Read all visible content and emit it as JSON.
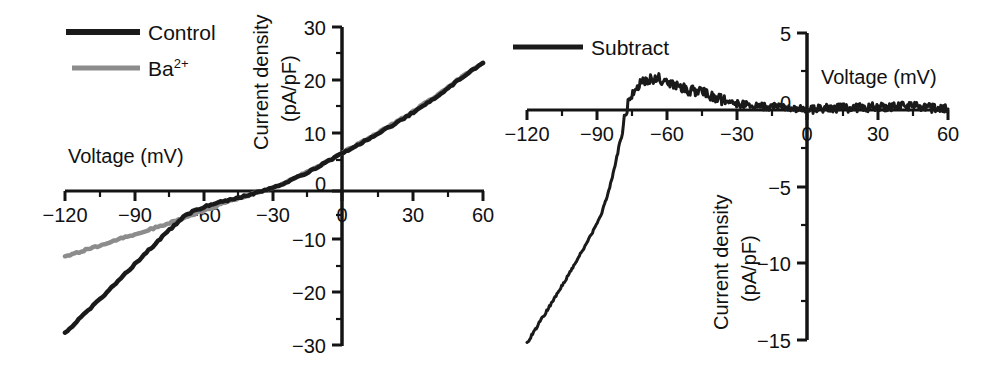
{
  "figure": {
    "background": "#ffffff",
    "panels": [
      "left",
      "right"
    ]
  },
  "colors": {
    "control": "#1a1a1a",
    "barium": "#8c8c8c",
    "subtract": "#1a1a1a",
    "axis": "#141414",
    "text": "#111111"
  },
  "left_panel": {
    "legend": {
      "items": [
        {
          "label": "Control",
          "color": "#1a1a1a"
        },
        {
          "label": "Ba",
          "superscript": "2+",
          "color": "#8c8c8c"
        }
      ]
    },
    "xlabel": "Voltage (mV)",
    "ylabel_line1": "Current density",
    "ylabel_line2": "(pA/pF)",
    "xticklabels": [
      "−120",
      "−90",
      "−60",
      "−30",
      "0",
      "30",
      "60"
    ],
    "yticklabels": [
      "30",
      "20",
      "10",
      "0",
      "−10",
      "−20",
      "−30"
    ]
  },
  "right_panel": {
    "legend": {
      "items": [
        {
          "label": "Subtract",
          "color": "#1a1a1a"
        }
      ]
    },
    "xlabel": "Voltage (mV)",
    "ylabel_line1": "Current density",
    "ylabel_line2": "(pA/pF)",
    "xticklabels": [
      "−120",
      "−90",
      "−60",
      "−30",
      "0",
      "30",
      "60"
    ],
    "yticklabels": [
      "5",
      "0",
      "−5",
      "−10",
      "−15"
    ]
  },
  "chart_data": [
    {
      "type": "line",
      "panel": "left",
      "title": "",
      "xlabel": "Voltage (mV)",
      "ylabel": "Current density (pA/pF)",
      "xlim": [
        -120,
        60
      ],
      "ylim": [
        -30,
        30
      ],
      "xticks": [
        -120,
        -90,
        -60,
        -30,
        0,
        30,
        60
      ],
      "yticks": [
        30,
        20,
        10,
        0,
        -10,
        -20,
        -30
      ],
      "xminorticks": [
        -105,
        -75,
        -45,
        -15,
        15,
        45
      ],
      "yminorticks": [
        25,
        15,
        5,
        -5,
        -15,
        -25
      ],
      "grid": false,
      "legend_position": "top-left",
      "series": [
        {
          "name": "Control",
          "color": "#1a1a1a",
          "x": [
            -120,
            -115,
            -110,
            -105,
            -100,
            -95,
            -90,
            -85,
            -80,
            -75,
            -72,
            -70,
            -67,
            -64,
            -60,
            -55,
            -50,
            -45,
            -40,
            -35,
            -30,
            -25,
            -20,
            -15,
            -10,
            -5,
            0,
            5,
            10,
            15,
            20,
            25,
            30,
            35,
            40,
            45,
            50,
            55,
            60
          ],
          "y": [
            -27.8,
            -25.6,
            -23.5,
            -21.3,
            -19.2,
            -17.0,
            -14.8,
            -12.6,
            -10.4,
            -8.3,
            -7.1,
            -6.2,
            -5.3,
            -4.6,
            -3.9,
            -3.2,
            -2.7,
            -2.2,
            -1.6,
            -1.0,
            -0.3,
            0.6,
            1.6,
            2.7,
            3.9,
            5.1,
            6.3,
            7.5,
            8.7,
            9.9,
            11.2,
            12.5,
            13.9,
            15.4,
            16.9,
            18.5,
            20.1,
            21.7,
            23.2
          ]
        },
        {
          "name": "Ba2+",
          "color": "#8c8c8c",
          "x": [
            -120,
            -115,
            -110,
            -105,
            -100,
            -95,
            -90,
            -85,
            -80,
            -75,
            -70,
            -65,
            -60,
            -55,
            -50,
            -45,
            -40,
            -35,
            -30,
            -25,
            -20,
            -15,
            -10,
            -5,
            0,
            5,
            10,
            15,
            20,
            25,
            30,
            35,
            40,
            45,
            50,
            55,
            60
          ],
          "y": [
            -13.3,
            -12.6,
            -11.9,
            -11.2,
            -10.5,
            -9.8,
            -9.1,
            -8.4,
            -7.7,
            -7.0,
            -6.2,
            -5.4,
            -4.6,
            -3.8,
            -3.0,
            -2.3,
            -1.6,
            -0.9,
            -0.2,
            0.7,
            1.7,
            2.8,
            4.0,
            5.2,
            6.4,
            7.6,
            8.8,
            10.1,
            11.4,
            12.7,
            14.1,
            15.6,
            17.1,
            18.7,
            20.3,
            21.8,
            23.3
          ]
        }
      ]
    },
    {
      "type": "line",
      "panel": "right",
      "title": "",
      "xlabel": "Voltage (mV)",
      "ylabel": "Current density (pA/pF)",
      "xlim": [
        -120,
        60
      ],
      "ylim": [
        -15,
        5
      ],
      "xticks": [
        -120,
        -90,
        -60,
        -30,
        0,
        30,
        60
      ],
      "yticks": [
        5,
        0,
        -5,
        -10,
        -15
      ],
      "xminorticks": [
        -105,
        -75,
        -45,
        -15,
        15,
        45
      ],
      "yminorticks": [
        2.5,
        -2.5,
        -7.5,
        -12.5
      ],
      "grid": false,
      "legend_position": "top-left",
      "series": [
        {
          "name": "Subtract",
          "color": "#1a1a1a",
          "x": [
            -120,
            -116,
            -112,
            -108,
            -104,
            -100,
            -96,
            -92,
            -88,
            -85,
            -82,
            -80,
            -78,
            -76,
            -74,
            -72,
            -70,
            -68,
            -66,
            -64,
            -62,
            -60,
            -57,
            -54,
            -51,
            -48,
            -45,
            -42,
            -39,
            -36,
            -33,
            -30,
            -25,
            -20,
            -15,
            -10,
            -5,
            0,
            5,
            10,
            15,
            20,
            25,
            30,
            35,
            40,
            45,
            50,
            55,
            60
          ],
          "y": [
            -15.2,
            -14.2,
            -13.2,
            -12.2,
            -11.2,
            -10.2,
            -9.1,
            -8.0,
            -6.7,
            -5.3,
            -3.4,
            -1.9,
            -0.4,
            0.8,
            1.3,
            1.6,
            1.8,
            1.9,
            2.0,
            2.1,
            1.9,
            1.8,
            1.6,
            1.5,
            1.3,
            1.2,
            1.1,
            0.9,
            0.8,
            0.6,
            0.5,
            0.4,
            0.3,
            0.25,
            0.2,
            0.15,
            0.1,
            0.05,
            0.05,
            0.1,
            0.1,
            0.15,
            0.15,
            0.2,
            0.2,
            0.25,
            0.2,
            0.15,
            0.1,
            0.05
          ]
        }
      ]
    }
  ]
}
